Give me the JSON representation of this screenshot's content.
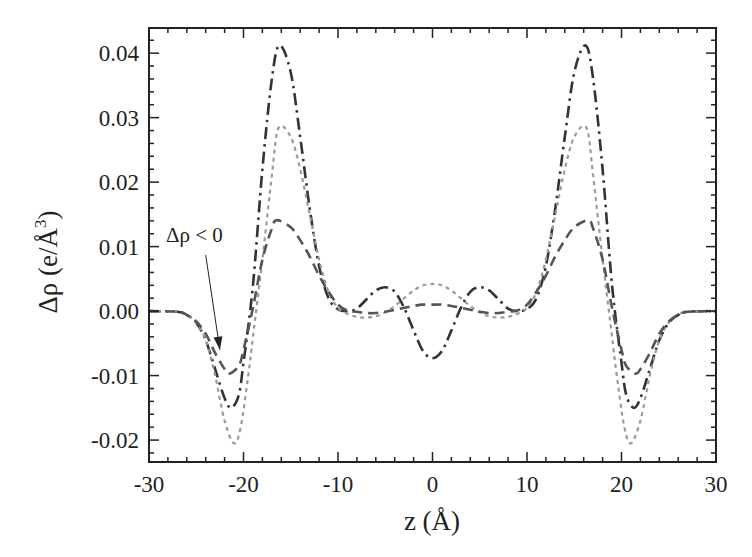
{
  "chart_data": {
    "type": "line",
    "title": "",
    "xlabel": "z (Å)",
    "ylabel": "Δρ (e/Å3)",
    "ylabel_main": "Δρ (e/Å",
    "ylabel_sup": "3",
    "ylabel_close": ")",
    "xlim": [
      -30,
      30
    ],
    "ylim": [
      -0.0234,
      0.0439
    ],
    "x_ticks": [
      -30,
      -20,
      -10,
      0,
      10,
      20,
      30
    ],
    "x_tick_labels": [
      "-30",
      "-20",
      "-10",
      "0",
      "10",
      "20",
      "30"
    ],
    "y_ticks": [
      -0.02,
      -0.01,
      0.0,
      0.01,
      0.02,
      0.03,
      0.04
    ],
    "y_tick_labels": [
      "-0.02",
      "-0.01",
      "0.00",
      "0.01",
      "0.02",
      "0.03",
      "0.04"
    ],
    "x_minor_step": 2,
    "y_minor_step": 0.002,
    "grid": false,
    "legend": null,
    "annotation": {
      "text": "Δρ < 0",
      "arrow_from": [
        -24.0,
        0.0087
      ],
      "arrow_to": [
        -22.5,
        -0.006
      ]
    },
    "symmetric_about_zero": true,
    "series": [
      {
        "name": "dash-dot",
        "style": "dashdot",
        "color": "#333333",
        "x": [
          -30,
          -27,
          -26,
          -25,
          -24,
          -23,
          -22,
          -21.3,
          -20.5,
          -20,
          -19,
          -18,
          -17,
          -16.2,
          -15,
          -14,
          -13,
          -12,
          -11,
          -10,
          -9,
          -8,
          -7,
          -6,
          -5,
          -4,
          -3,
          -2,
          -1,
          0
        ],
        "y": [
          0,
          -0.0001,
          -0.0006,
          -0.0018,
          -0.0045,
          -0.009,
          -0.0135,
          -0.015,
          -0.013,
          -0.008,
          0.004,
          0.022,
          0.036,
          0.0412,
          0.037,
          0.027,
          0.016,
          0.007,
          0.002,
          0.0003,
          0.0,
          0.0004,
          0.0018,
          0.0032,
          0.0037,
          0.003,
          0.0005,
          -0.003,
          -0.0062,
          -0.0073
        ]
      },
      {
        "name": "dotted",
        "style": "dotted",
        "color": "#9a9a9a",
        "x": [
          -30,
          -27,
          -26,
          -25,
          -24,
          -23,
          -22,
          -21,
          -20.3,
          -19.5,
          -19,
          -18,
          -17,
          -16.3,
          -15,
          -14,
          -13,
          -12,
          -11,
          -10,
          -9,
          -8,
          -7,
          -6,
          -5,
          -4,
          -3,
          -2,
          -1,
          0
        ],
        "y": [
          0,
          -0.0001,
          -0.0006,
          -0.0018,
          -0.0045,
          -0.01,
          -0.017,
          -0.0205,
          -0.018,
          -0.01,
          -0.004,
          0.008,
          0.021,
          0.0284,
          0.027,
          0.022,
          0.015,
          0.008,
          0.003,
          0.0005,
          -0.0004,
          -0.0009,
          -0.001,
          -0.0008,
          -0.0002,
          0.0008,
          0.002,
          0.0032,
          0.004,
          0.0042
        ]
      },
      {
        "name": "dashed",
        "style": "dashed",
        "color": "#555555",
        "x": [
          -30,
          -27,
          -26,
          -25,
          -24,
          -23,
          -22,
          -21.5,
          -20.5,
          -20,
          -19,
          -18,
          -17,
          -16.5,
          -15,
          -14,
          -13,
          -12,
          -11,
          -10,
          -9,
          -8,
          -7,
          -6,
          -5,
          -4,
          -3,
          -2,
          -1,
          0
        ],
        "y": [
          0,
          -0.0001,
          -0.0006,
          -0.0016,
          -0.0035,
          -0.0065,
          -0.009,
          -0.0097,
          -0.0085,
          -0.006,
          0.0005,
          0.008,
          0.0128,
          0.0141,
          0.013,
          0.011,
          0.0085,
          0.0055,
          0.003,
          0.001,
          0.0001,
          -0.0001,
          -0.0003,
          -0.0003,
          -0.0001,
          0.0002,
          0.0005,
          0.0008,
          0.001,
          0.001
        ]
      }
    ]
  },
  "layout": {
    "plot": {
      "left": 149,
      "top": 28,
      "right": 716,
      "bottom": 462
    }
  }
}
